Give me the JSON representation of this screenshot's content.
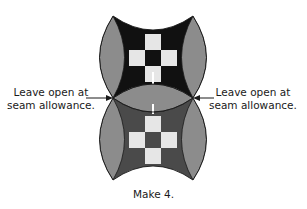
{
  "diagram": {
    "annotations": {
      "left": {
        "line1": "Leave open at",
        "line2": "seam allowance."
      },
      "right": {
        "line1": "Leave open at",
        "line2": "seam allowance."
      }
    },
    "caption": "Make 4.",
    "colors": {
      "gray_arc": "#8c8c8c",
      "top_dark": "#111111",
      "bottom_dark": "#4a4a4a",
      "light_square": "#e6e6e6",
      "outline": "#1a1a1a"
    },
    "blocks": [
      {
        "name": "top-block",
        "center_dark": "black"
      },
      {
        "name": "bottom-block",
        "center_dark": "dark-gray"
      }
    ]
  }
}
